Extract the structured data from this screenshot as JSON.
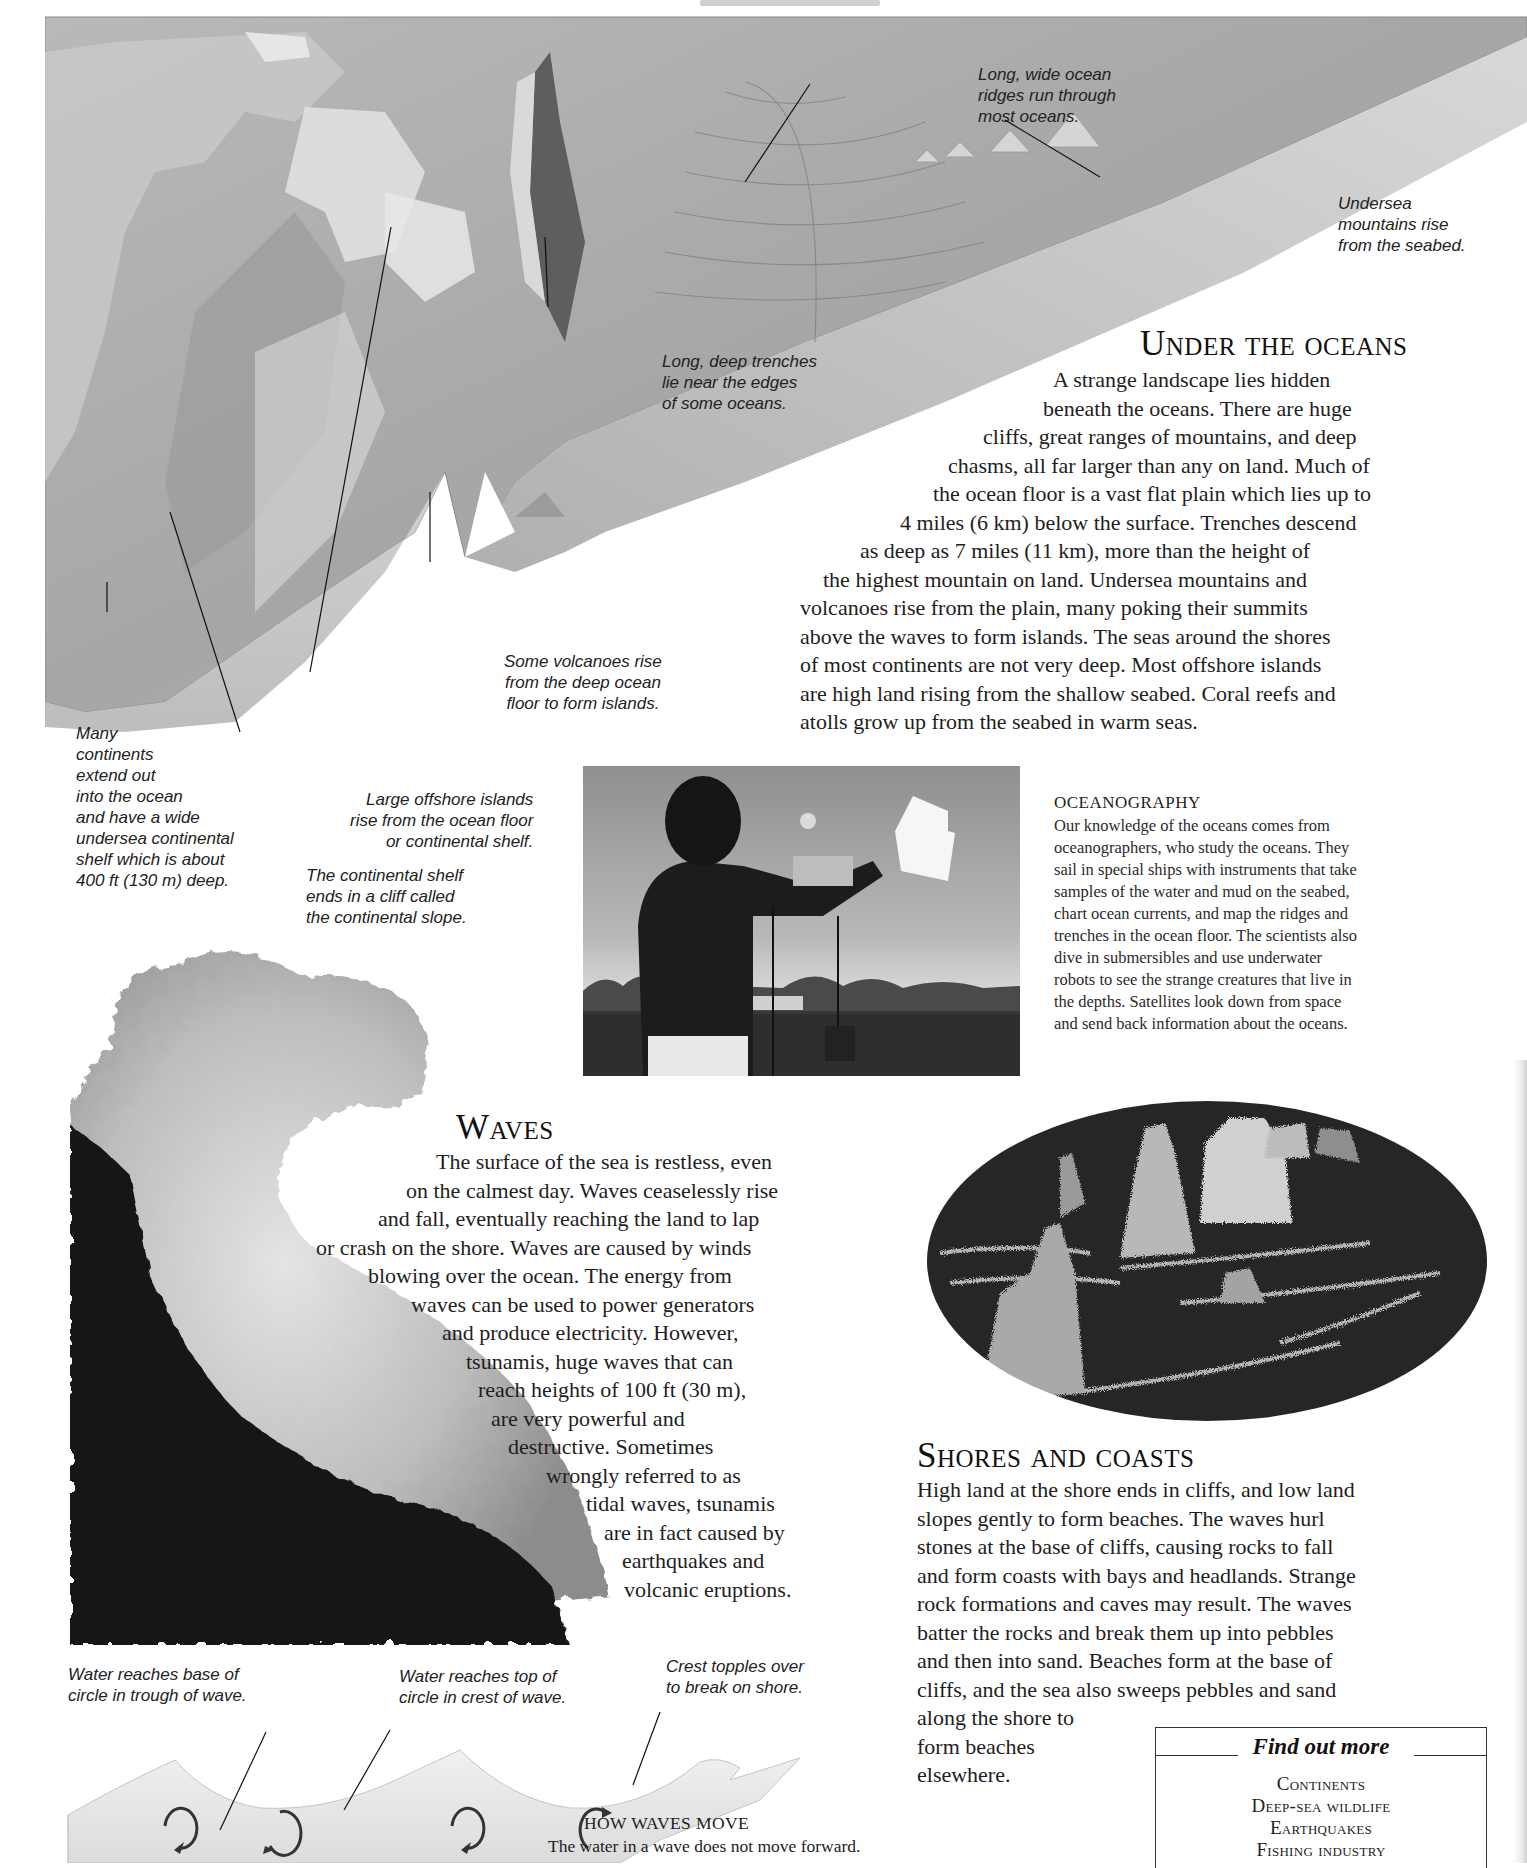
{
  "page": {
    "running_head": "OCEANS AND SEAS"
  },
  "seabed_diagram": {
    "captions": {
      "ocean_ridges": "Long, wide ocean\nridges run through\nmost oceans.",
      "undersea_mountains": "Undersea\nmountains rise\nfrom the seabed.",
      "trenches": "Long, deep trenches\nlie near the edges\nof some oceans.",
      "volcanoes": "Some volcanoes rise\nfrom the deep ocean\nfloor to form islands.",
      "continental_shelf": "Many\ncontinents\nextend out\ninto the ocean\nand have a wide\nundersea continental\nshelf which is about\n400 ft (130 m) deep.",
      "offshore_islands": "Large offshore islands\nrise from the ocean floor\nor continental shelf.",
      "continental_slope": "The continental shelf\nends in a cliff called\nthe continental slope."
    }
  },
  "under_the_oceans": {
    "heading": "Under the oceans",
    "lines": [
      "A strange landscape lies hidden",
      "beneath the oceans. There are huge",
      "cliffs, great ranges of mountains, and deep",
      "chasms, all far larger than any on land. Much of",
      "the ocean floor is a vast flat plain which lies up to",
      "4 miles (6 km) below the surface. Trenches descend",
      "as deep as 7 miles (11 km), more than the height of",
      "the highest mountain on land. Undersea mountains and",
      "volcanoes rise from the plain, many poking their summits",
      "above the waves to form islands. The seas around the shores",
      "of most continents are not very deep. Most offshore islands",
      "are high land rising from the shallow seabed. Coral reefs and",
      "atolls grow up from the seabed in warm seas."
    ]
  },
  "oceanography": {
    "heading": "OCEANOGRAPHY",
    "lines": [
      "Our knowledge of the oceans comes from",
      "oceanographers, who study the oceans. They",
      "sail in special ships with instruments that take",
      "samples of the water and mud on the seabed,",
      "chart ocean currents, and map the ridges and",
      "trenches in the ocean floor. The scientists also",
      "dive in submersibles and use underwater",
      "robots to see the strange creatures that live in",
      "the depths. Satellites look down from space",
      "and send back information about the oceans."
    ]
  },
  "waves": {
    "heading": "Waves",
    "lines": [
      "The surface of the sea is restless, even",
      "on the calmest day. Waves ceaselessly rise",
      "and fall, eventually reaching the land to lap",
      "or crash on the shore. Waves are caused by winds",
      "blowing over the ocean. The energy from",
      "waves can be used to power generators",
      "and produce electricity. However,",
      "tsunamis, huge waves that can",
      "reach heights of 100 ft (30 m),",
      "are very powerful and",
      "destructive. Sometimes",
      "wrongly referred to as",
      "tidal waves, tsunamis",
      "are in fact caused by",
      "earthquakes and",
      "volcanic eruptions."
    ]
  },
  "shores_and_coasts": {
    "heading": "Shores and coasts",
    "lines": [
      "High land at the shore ends in cliffs, and low land",
      "slopes gently to form beaches. The waves hurl",
      "stones at the base of cliffs, causing rocks to fall",
      "and form coasts with bays and headlands. Strange",
      "rock formations and caves may result. The waves",
      "batter the rocks and break them up into pebbles",
      "and then into sand. Beaches form at the base of",
      "cliffs, and the sea also sweeps pebbles and sand",
      "along the shore to",
      "form beaches",
      "elsewhere."
    ]
  },
  "wave_diagram": {
    "captions": {
      "trough": "Water reaches base of\ncircle in trough of wave.",
      "crest": "Water reaches top of\ncircle in crest of wave.",
      "topples": "Crest topples over\nto break on shore."
    },
    "title": "HOW WAVES MOVE",
    "subtitle": "The water in a wave does not move forward."
  },
  "find_out_more": {
    "title": "Find out more",
    "items": [
      "Continents",
      "Deep-sea wildlife",
      "Earthquakes",
      "Fishing industry"
    ]
  }
}
